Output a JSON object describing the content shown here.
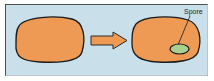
{
  "figure": {
    "colors": {
      "background": "#c9e0ea",
      "frame_border": "#4a4f55",
      "cell_fill": "#ee9a55",
      "cell_outline": "#1a1a1a",
      "arrow_fill": "#ee9a55",
      "spore_fill": "#a9d08e"
    },
    "stages": [
      {
        "name": "vegetative-cell",
        "has_spore": false
      },
      {
        "name": "cell-with-spore",
        "has_spore": true
      }
    ],
    "arrow": {
      "direction": "right"
    },
    "labels": {
      "spore": "Spore"
    }
  }
}
